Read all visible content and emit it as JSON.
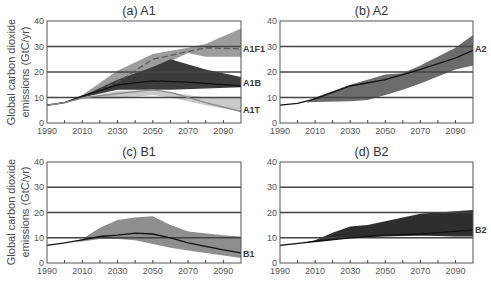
{
  "figure": {
    "ylabel_line1": "Global carbon dioxide",
    "ylabel_line2": "emissions (GtC/yr)"
  },
  "chart_data": [
    {
      "id": "a",
      "type": "area",
      "title": "(a) A1",
      "xlabel": "",
      "ylabel": "Global carbon dioxide emissions (GtC/yr)",
      "xlim": [
        1990,
        2100
      ],
      "ylim": [
        0,
        40
      ],
      "xticks": [
        1990,
        2010,
        2030,
        2050,
        2070,
        2090
      ],
      "yticks": [
        0,
        10,
        20,
        30,
        40
      ],
      "grid_y": [
        10,
        20,
        30
      ],
      "series": [
        {
          "name": "A1F1",
          "fill": "#9c9c9c",
          "line_style": "dashed",
          "line_color": "#5a5a5a",
          "label_y": 29,
          "band_x": [
            2000,
            2010,
            2030,
            2050,
            2070,
            2080,
            2100
          ],
          "band_upper": [
            8,
            11,
            20.5,
            27,
            29.5,
            31,
            37
          ],
          "band_lower": [
            8,
            10,
            14,
            21,
            27.5,
            26,
            26
          ],
          "x": [
            1990,
            2000,
            2010,
            2030,
            2050,
            2070,
            2080,
            2100
          ],
          "values": [
            7,
            8,
            10,
            16,
            25,
            28,
            29.5,
            29
          ]
        },
        {
          "name": "A1B",
          "fill": "#3c3c3c",
          "line_style": "solid",
          "line_color": "#111111",
          "label_y": 15.5,
          "band_x": [
            2000,
            2010,
            2030,
            2050,
            2060,
            2080,
            2100
          ],
          "band_upper": [
            8,
            10.5,
            17,
            22,
            25,
            21,
            18
          ],
          "band_lower": [
            8,
            10,
            13,
            13,
            13,
            13.5,
            14
          ],
          "x": [
            1990,
            2000,
            2010,
            2030,
            2050,
            2070,
            2100
          ],
          "values": [
            7,
            8,
            10.5,
            15,
            16.5,
            16,
            14.5
          ]
        },
        {
          "name": "A1T",
          "fill": "#cacaca",
          "line_style": "solid",
          "line_color": "#8a8a8a",
          "label_y": 5,
          "band_x": [
            2000,
            2010,
            2030,
            2050,
            2060,
            2080,
            2100
          ],
          "band_upper": [
            8,
            10,
            12.5,
            13,
            12,
            10,
            10
          ],
          "band_lower": [
            8,
            9.5,
            9.5,
            11,
            10,
            7,
            4.5
          ],
          "x": [
            1990,
            2000,
            2010,
            2030,
            2050,
            2060,
            2080,
            2100
          ],
          "values": [
            7,
            8,
            9.8,
            11.5,
            13,
            12,
            8,
            4.5
          ]
        }
      ]
    },
    {
      "id": "b",
      "type": "area",
      "title": "(b) A2",
      "xlabel": "",
      "ylabel": "",
      "xlim": [
        1990,
        2100
      ],
      "ylim": [
        0,
        40
      ],
      "xticks": [
        1990,
        2010,
        2030,
        2050,
        2070,
        2090
      ],
      "yticks": [
        0,
        10,
        20,
        30,
        40
      ],
      "grid_y": [
        10,
        20,
        30
      ],
      "series": [
        {
          "name": "A2",
          "fill": "#6c6c6c",
          "line_style": "solid",
          "line_color": "#111111",
          "label_y": 29,
          "band_x": [
            2005,
            2010,
            2030,
            2040,
            2050,
            2060,
            2070,
            2090,
            2100
          ],
          "band_upper": [
            8,
            10,
            15,
            17,
            19,
            19.5,
            22.5,
            29.5,
            34.5
          ],
          "band_lower": [
            8,
            8.2,
            8.5,
            9,
            11,
            13,
            15.5,
            21,
            22.5
          ],
          "x": [
            1990,
            2000,
            2010,
            2030,
            2050,
            2060,
            2070,
            2090,
            2100
          ],
          "values": [
            7,
            7.7,
            9.5,
            14.5,
            17,
            19,
            21,
            25.5,
            28.5
          ]
        }
      ]
    },
    {
      "id": "c",
      "type": "area",
      "title": "(c) B1",
      "xlabel": "",
      "ylabel": "Global carbon dioxide emissions (GtC/yr)",
      "xlim": [
        1990,
        2100
      ],
      "ylim": [
        0,
        40
      ],
      "xticks": [
        1990,
        2010,
        2030,
        2050,
        2070,
        2090
      ],
      "yticks": [
        0,
        10,
        20,
        30,
        40
      ],
      "grid_y": [
        10,
        20,
        30
      ],
      "series": [
        {
          "name": "B1",
          "fill": "#8e8e8e",
          "line_style": "solid",
          "line_color": "#111111",
          "label_y": 3.5,
          "band_x": [
            2005,
            2010,
            2020,
            2030,
            2040,
            2050,
            2060,
            2070,
            2090,
            2100
          ],
          "band_upper": [
            8.5,
            9.5,
            14,
            17,
            18,
            18.5,
            15,
            12.5,
            11,
            10.5
          ],
          "band_lower": [
            8.5,
            8.5,
            9.5,
            9.5,
            9,
            7.5,
            6,
            5,
            3,
            2
          ],
          "x": [
            1990,
            2000,
            2010,
            2020,
            2030,
            2040,
            2050,
            2060,
            2070,
            2090,
            2100
          ],
          "values": [
            7,
            8,
            9.2,
            10.5,
            11,
            11.8,
            11.5,
            10,
            8,
            5.2,
            4
          ]
        }
      ]
    },
    {
      "id": "d",
      "type": "area",
      "title": "(d) B2",
      "xlabel": "",
      "ylabel": "",
      "xlim": [
        1990,
        2100
      ],
      "ylim": [
        0,
        40
      ],
      "xticks": [
        1990,
        2010,
        2030,
        2050,
        2070,
        2090
      ],
      "yticks": [
        0,
        10,
        20,
        30,
        40
      ],
      "grid_y": [
        10,
        20,
        30
      ],
      "series": [
        {
          "name": "B2",
          "fill": "#2e2e2e",
          "line_style": "solid",
          "line_color": "#111111",
          "label_y": 13,
          "band_x": [
            2003,
            2010,
            2020,
            2030,
            2040,
            2050,
            2060,
            2070,
            2080,
            2090,
            2100
          ],
          "band_upper": [
            8,
            9,
            12,
            14.5,
            15,
            16.5,
            18,
            19.5,
            20,
            20.5,
            21
          ],
          "band_lower": [
            8,
            8.5,
            9.2,
            10,
            10.3,
            10.5,
            10.7,
            10.8,
            10.7,
            10.5,
            10.5
          ],
          "x": [
            1990,
            2003,
            2010,
            2030,
            2050,
            2070,
            2080,
            2100
          ],
          "values": [
            7,
            8,
            8.5,
            10,
            11,
            11.5,
            12,
            13
          ]
        }
      ]
    }
  ]
}
